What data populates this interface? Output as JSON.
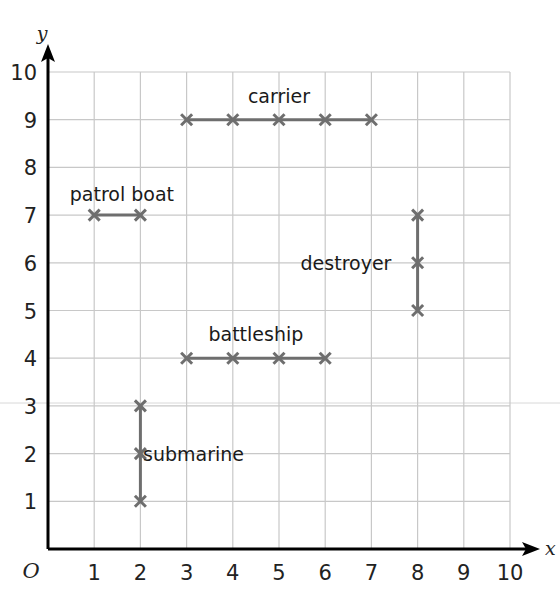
{
  "chart_data": {
    "type": "scatter",
    "title": "",
    "xlabel": "x",
    "ylabel": "y",
    "origin_label": "O",
    "xlim": [
      0,
      10
    ],
    "ylim": [
      0,
      10
    ],
    "grid": true,
    "x_ticks": [
      "1",
      "2",
      "3",
      "4",
      "5",
      "6",
      "7",
      "8",
      "9",
      "10"
    ],
    "y_ticks": [
      "1",
      "2",
      "3",
      "4",
      "5",
      "6",
      "7",
      "8",
      "9",
      "10"
    ],
    "series": [
      {
        "name": "carrier",
        "orientation": "horizontal",
        "points": [
          [
            3,
            9
          ],
          [
            4,
            9
          ],
          [
            5,
            9
          ],
          [
            6,
            9
          ],
          [
            7,
            9
          ]
        ],
        "label_pos": [
          5,
          9.5
        ]
      },
      {
        "name": "patrol boat",
        "orientation": "horizontal",
        "points": [
          [
            1,
            7
          ],
          [
            2,
            7
          ]
        ],
        "label_pos": [
          1.6,
          7.45
        ]
      },
      {
        "name": "destroyer",
        "orientation": "vertical",
        "points": [
          [
            8,
            5
          ],
          [
            8,
            6
          ],
          [
            8,
            7
          ]
        ],
        "label_pos": [
          6.45,
          6
        ]
      },
      {
        "name": "battleship",
        "orientation": "horizontal",
        "points": [
          [
            3,
            4
          ],
          [
            4,
            4
          ],
          [
            5,
            4
          ],
          [
            6,
            4
          ]
        ],
        "label_pos": [
          4.5,
          4.5
        ]
      },
      {
        "name": "submarine",
        "orientation": "vertical",
        "points": [
          [
            2,
            1
          ],
          [
            2,
            2
          ],
          [
            2,
            3
          ]
        ],
        "label_pos": [
          3.15,
          2
        ]
      }
    ],
    "colors": {
      "axis": "#000000",
      "grid": "#c8c8c8",
      "ship_line": "#6e6e6e",
      "marker": "#6e6e6e",
      "text": "#1a1a1a"
    }
  }
}
